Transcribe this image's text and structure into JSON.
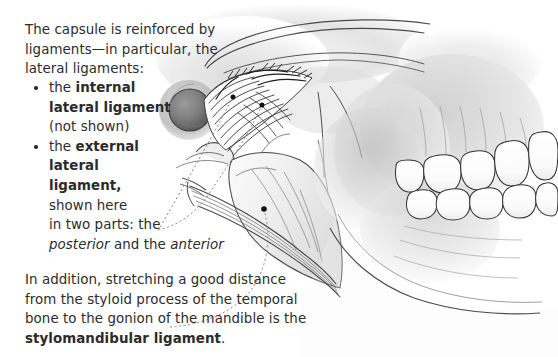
{
  "figure": {
    "background": "#ffffff",
    "text_color": "#2b2b2b",
    "width": 558,
    "height": 357
  },
  "intro": {
    "line1": "The capsule is reinforced by",
    "line2": "ligaments—in particular, the",
    "line3": "lateral ligaments:"
  },
  "bullets": [
    {
      "lead": "the ",
      "bold": "internal",
      "bold2": "lateral ligament",
      "tail": "(not shown)"
    },
    {
      "lead": "the ",
      "bold": "external",
      "bold2": "lateral",
      "bold3": "ligament,",
      "tail1": "shown here",
      "tail2": "in two parts: the",
      "italic1": "posterior",
      "mid": " and the ",
      "italic2": "anterior"
    }
  ],
  "note": {
    "line1": "In addition, stretching a good distance",
    "line2": "from the styloid process of the temporal",
    "line3": "bone to the gonion of the mandible is the",
    "bold": "stylomandibular ligament",
    "period": "."
  },
  "markers": [
    {
      "name": "posterior-band-marker",
      "x": 233,
      "y": 97
    },
    {
      "name": "anterior-band-marker",
      "x": 262,
      "y": 105
    },
    {
      "name": "stylomandibular-marker",
      "x": 264,
      "y": 209
    }
  ],
  "colors": {
    "ink": "#3a3a3a",
    "shade_light": "#e9e9e9",
    "shade_mid": "#cfcfcf",
    "shade_dark": "#a8a8a8",
    "leader": "#8d8d8d",
    "marker": "#111111"
  }
}
